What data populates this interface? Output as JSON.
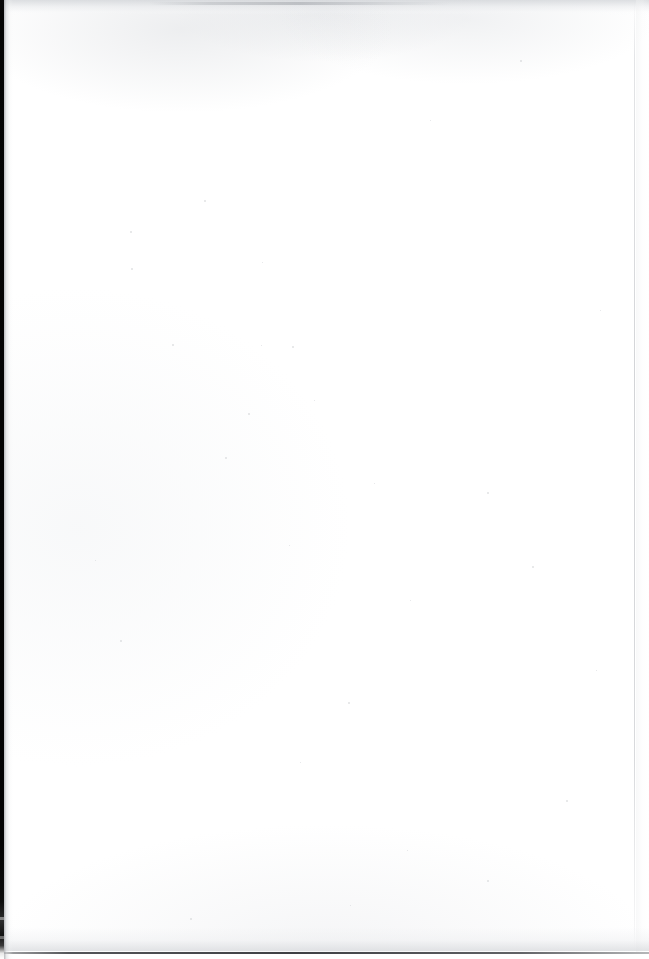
{
  "document": {
    "kind": "scanned-page",
    "page_content": "",
    "body_text": "",
    "page_number": "",
    "header_text": "",
    "footer_text": "",
    "note": "blank page"
  },
  "page": {
    "width_px": 649,
    "height_px": 959,
    "background_color": "#ffffff",
    "paper_tone": "#fefefe"
  },
  "artifacts": {
    "left_gutter": {
      "name": "scanner binding edge",
      "color": "#050505",
      "width_px": 4,
      "top_px": 0,
      "height_px": 959
    },
    "left_gutter_shadow": {
      "name": "page edge shadow",
      "color": "#a8aaae",
      "left_px": 4,
      "width_px": 9
    },
    "top_edge_band": {
      "name": "top scan smudge",
      "color": "#ced1d5",
      "top_px": 0,
      "height_px": 15
    },
    "bottom_rule": {
      "name": "bottom page edge line",
      "color": "#34363a",
      "top_px": 952,
      "height_px": 2
    },
    "right_edge_line": {
      "name": "right page edge line",
      "color": "#c4c6ca",
      "left_px": 634,
      "width_px": 1
    },
    "specks": [
      {
        "x": 130,
        "y": 231,
        "d": 2
      },
      {
        "x": 131,
        "y": 268,
        "d": 2
      },
      {
        "x": 204,
        "y": 200,
        "d": 2
      },
      {
        "x": 262,
        "y": 262,
        "d": 1
      },
      {
        "x": 172,
        "y": 344,
        "d": 2
      },
      {
        "x": 261,
        "y": 345,
        "d": 1
      },
      {
        "x": 292,
        "y": 346,
        "d": 2
      },
      {
        "x": 248,
        "y": 413,
        "d": 2
      },
      {
        "x": 314,
        "y": 400,
        "d": 1
      },
      {
        "x": 225,
        "y": 457,
        "d": 2
      },
      {
        "x": 374,
        "y": 483,
        "d": 1
      },
      {
        "x": 487,
        "y": 492,
        "d": 2
      },
      {
        "x": 289,
        "y": 545,
        "d": 1
      },
      {
        "x": 532,
        "y": 566,
        "d": 2
      },
      {
        "x": 410,
        "y": 600,
        "d": 1
      },
      {
        "x": 120,
        "y": 640,
        "d": 2
      },
      {
        "x": 596,
        "y": 670,
        "d": 1
      },
      {
        "x": 348,
        "y": 702,
        "d": 2
      },
      {
        "x": 300,
        "y": 762,
        "d": 1
      },
      {
        "x": 566,
        "y": 800,
        "d": 2
      },
      {
        "x": 407,
        "y": 850,
        "d": 1
      },
      {
        "x": 487,
        "y": 880,
        "d": 2
      },
      {
        "x": 350,
        "y": 905,
        "d": 1
      },
      {
        "x": 190,
        "y": 918,
        "d": 2
      },
      {
        "x": 95,
        "y": 560,
        "d": 1
      },
      {
        "x": 430,
        "y": 120,
        "d": 1
      },
      {
        "x": 520,
        "y": 60,
        "d": 2
      },
      {
        "x": 600,
        "y": 310,
        "d": 1
      }
    ]
  }
}
